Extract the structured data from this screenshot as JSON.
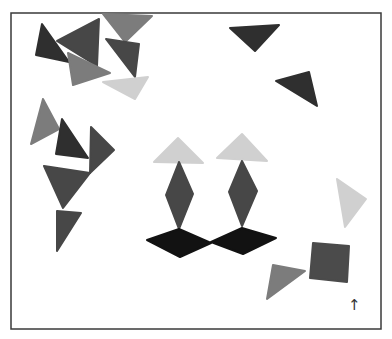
{
  "canvas": {
    "width": 392,
    "height": 339,
    "background": "#ffffff"
  },
  "frame": {
    "x": 11,
    "y": 13,
    "width": 370,
    "height": 316,
    "stroke": "#3a3a3a",
    "stroke_width": 1.5
  },
  "colors": {
    "darkest": "#2f2f2f",
    "dark": "#474747",
    "medium": "#7c7c7c",
    "light": "#d0d0d0",
    "black": "#121212",
    "square": "#4b4b4b"
  },
  "scattered_shapes": [
    {
      "name": "triangle-top-left-darkest",
      "type": "triangle",
      "shade": "darkest",
      "points": "42,24 36,55 69,62"
    },
    {
      "name": "triangle-top-left-dark-large",
      "type": "triangle",
      "shade": "dark",
      "points": "57,41 99,19 97,66"
    },
    {
      "name": "triangle-top-medium",
      "type": "triangle",
      "shade": "medium",
      "points": "103,14 152,16 125,42"
    },
    {
      "name": "triangle-top-dark-small",
      "type": "triangle",
      "shade": "dark",
      "points": "106,39 139,44 135,77"
    },
    {
      "name": "triangle-top-left-medium",
      "type": "triangle",
      "shade": "medium",
      "points": "68,53 73,85 110,73"
    },
    {
      "name": "triangle-top-light",
      "type": "triangle",
      "shade": "light",
      "points": "103,82 148,77 135,99"
    },
    {
      "name": "triangle-left-medium",
      "type": "triangle",
      "shade": "medium",
      "points": "43,99 31,144 59,129"
    },
    {
      "name": "triangle-left-darkest",
      "type": "triangle",
      "shade": "darkest",
      "points": "62,119 56,154 88,158"
    },
    {
      "name": "triangle-left-dark-right",
      "type": "triangle",
      "shade": "dark",
      "points": "91,127 114,150 90,173"
    },
    {
      "name": "triangle-left-dark-large",
      "type": "triangle",
      "shade": "dark",
      "points": "44,166 90,173 63,208"
    },
    {
      "name": "triangle-left-dark-bottom",
      "type": "triangle",
      "shade": "dark",
      "points": "57,211 81,213 57,251"
    },
    {
      "name": "triangle-top-right-dark",
      "type": "triangle",
      "shade": "darkest",
      "points": "230,28 279,25 255,51"
    },
    {
      "name": "triangle-right-dark",
      "type": "triangle",
      "shade": "darkest",
      "points": "276,81 309,72 317,106"
    },
    {
      "name": "triangle-right-light",
      "type": "triangle",
      "shade": "light",
      "points": "337,179 366,199 345,227"
    },
    {
      "name": "triangle-bottom-medium",
      "type": "triangle",
      "shade": "medium",
      "points": "273,265 305,271 267,299"
    },
    {
      "name": "square-bottom-right",
      "type": "square",
      "shade": "square",
      "points": "313,243 349,246 347,282 310,278"
    }
  ],
  "figures": [
    {
      "name": "figure-left",
      "parts": [
        {
          "name": "figure-left-head-triangle",
          "type": "triangle",
          "shade": "light",
          "points": "178,138 154,162 203,163"
        },
        {
          "name": "figure-left-body-diamond",
          "type": "diamond",
          "shade": "dark",
          "points": "179,162 166,195 179,229 193,194"
        },
        {
          "name": "figure-left-base-rhombus",
          "type": "rhombus",
          "shade": "black",
          "points": "147,240 179,229 211,243 180,257"
        }
      ]
    },
    {
      "name": "figure-right",
      "parts": [
        {
          "name": "figure-right-head-triangle",
          "type": "triangle",
          "shade": "light",
          "points": "242,134 217,158 267,161"
        },
        {
          "name": "figure-right-body-diamond",
          "type": "diamond",
          "shade": "dark",
          "points": "242,161 229,192 242,226 257,191"
        },
        {
          "name": "figure-right-base-rhombus",
          "type": "rhombus",
          "shade": "black",
          "points": "211,242 242,228 276,238 243,254"
        }
      ]
    }
  ],
  "arrow": {
    "glyph": "↑",
    "x": 348,
    "y": 298
  }
}
